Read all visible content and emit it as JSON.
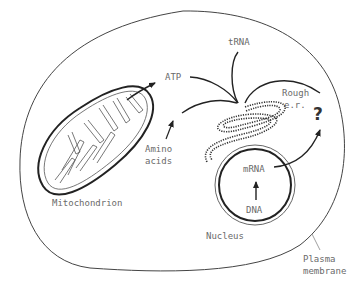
{
  "diagram": {
    "labels": {
      "atp": "ATP",
      "trna": "tRNA",
      "rough_er_1": "Rough",
      "rough_er_2": "e.r.",
      "question": "?",
      "amino_1": "Amino",
      "amino_2": "acids",
      "mitochondrion": "Mitochondrion",
      "mrna": "mRNA",
      "dna": "DNA",
      "nucleus": "Nucleus",
      "plasma_1": "Plasma",
      "plasma_2": "membrane"
    },
    "colors": {
      "stroke": "#2a2a2a",
      "label": "#6a6a6a",
      "background": "#ffffff"
    }
  }
}
